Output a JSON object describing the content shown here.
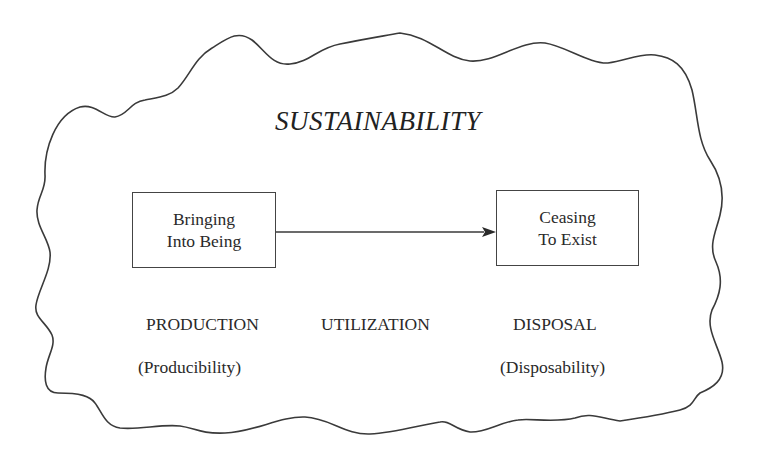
{
  "diagram": {
    "title": "SUSTAINABILITY",
    "boundary_shape": "cloud-outline",
    "boxes": [
      {
        "id": "start",
        "lines": [
          "Bringing",
          "Into Being"
        ]
      },
      {
        "id": "end",
        "lines": [
          "Ceasing",
          "To Exist"
        ]
      }
    ],
    "arrow": {
      "from": "start",
      "to": "end"
    },
    "stages": [
      {
        "label": "PRODUCTION",
        "attribute": "(Producibility)"
      },
      {
        "label": "UTILIZATION",
        "attribute": ""
      },
      {
        "label": "DISPOSAL",
        "attribute": "(Disposability)"
      }
    ],
    "colors": {
      "line": "#3a3a3a",
      "text": "#2a2a2a",
      "background": "#ffffff"
    }
  }
}
